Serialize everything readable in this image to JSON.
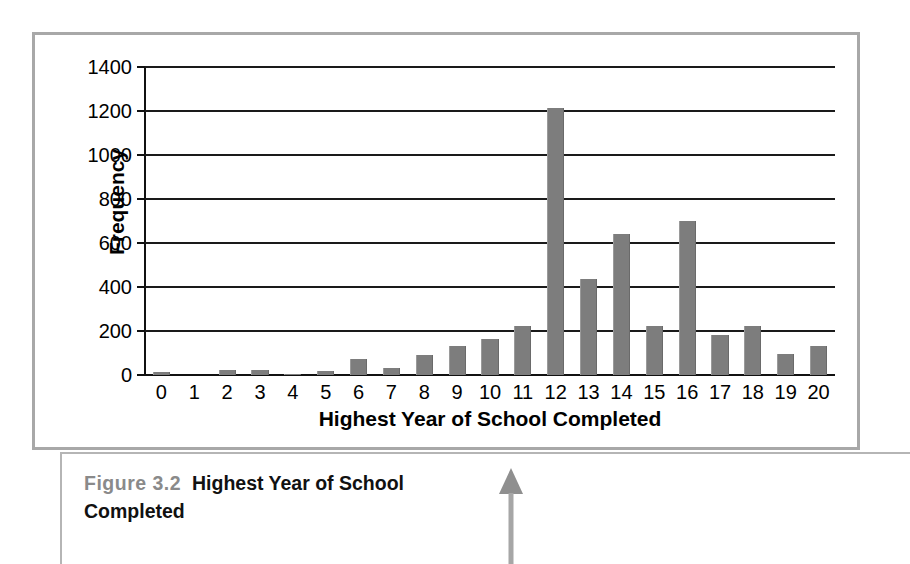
{
  "figure": {
    "caption_number": "Figure 3.2",
    "caption_title": "Highest Year of School Completed"
  },
  "chart_data": {
    "type": "bar",
    "title": "",
    "xlabel": "Highest Year of School Completed",
    "ylabel": "Frequency",
    "categories": [
      "0",
      "1",
      "2",
      "3",
      "4",
      "5",
      "6",
      "7",
      "8",
      "9",
      "10",
      "11",
      "12",
      "13",
      "14",
      "15",
      "16",
      "17",
      "18",
      "19",
      "20"
    ],
    "values": [
      15,
      0,
      22,
      24,
      6,
      16,
      75,
      30,
      92,
      132,
      165,
      225,
      1215,
      435,
      640,
      225,
      700,
      180,
      225,
      95,
      130
    ],
    "ylim": [
      0,
      1400
    ],
    "yticks": [
      0,
      200,
      400,
      600,
      800,
      1000,
      1200,
      1400
    ],
    "ytick_labels": [
      "0",
      "200",
      "400",
      "600",
      "800",
      "1000",
      "1200",
      "1400"
    ],
    "grid": true,
    "legend": false,
    "bar_color": "#7d7d7d",
    "axis_color": "#111111",
    "frame_color": "#a8a8a8"
  },
  "annotation": {
    "arrow_name": "up-arrow",
    "arrow_color": "#9a9a9a"
  }
}
